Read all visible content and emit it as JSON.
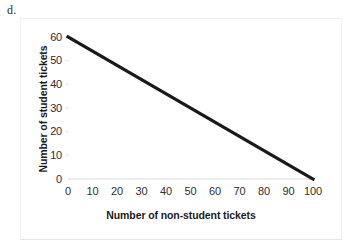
{
  "part_label": "d.",
  "chart_data": {
    "type": "line",
    "title": "",
    "xlabel": "Number of non-student tickets",
    "ylabel": "Number of student tickets",
    "xlim": [
      0,
      100
    ],
    "ylim": [
      0,
      60
    ],
    "x_ticks": [
      0,
      10,
      20,
      30,
      40,
      50,
      60,
      70,
      80,
      90,
      100
    ],
    "y_ticks": [
      0,
      10,
      20,
      30,
      40,
      50,
      60
    ],
    "grid": false,
    "legend": "none",
    "series": [
      {
        "name": "tickets",
        "x": [
          0,
          100
        ],
        "values": [
          60,
          0
        ],
        "color": "#1a1a1a",
        "line_width": 3.2
      }
    ],
    "annotations": []
  },
  "axis_style": {
    "axis_line_color": "#d9d9d9",
    "tick_mark_color": "#e8e8e8",
    "frame_color": "#ededed"
  }
}
